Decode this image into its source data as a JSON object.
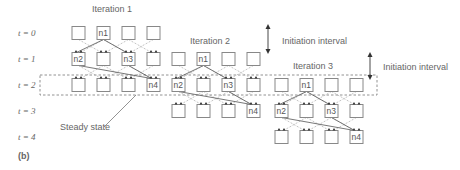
{
  "figure_label": "(b)",
  "time_rows": [
    {
      "label": "t = 0",
      "y": 33
    },
    {
      "label": "t = 1",
      "y": 59
    },
    {
      "label": "t = 2",
      "y": 85
    },
    {
      "label": "t = 3",
      "y": 111
    },
    {
      "label": "t = 4",
      "y": 137
    }
  ],
  "iterations": [
    {
      "title": "Iteration 1",
      "title_x": 92,
      "title_y": 12,
      "x0": 72,
      "row0": 0,
      "nodes": [
        {
          "label": "n1",
          "row": 0,
          "col": 1
        },
        {
          "label": "n2",
          "row": 1,
          "col": 0
        },
        {
          "label": "n3",
          "row": 1,
          "col": 2
        },
        {
          "label": "n4",
          "row": 2,
          "col": 3
        }
      ]
    },
    {
      "title": "Iteration 2",
      "title_x": 190,
      "title_y": 44,
      "x0": 172,
      "row0": 1,
      "nodes": [
        {
          "label": "n1",
          "row": 0,
          "col": 1
        },
        {
          "label": "n2",
          "row": 1,
          "col": 0
        },
        {
          "label": "n3",
          "row": 1,
          "col": 2
        },
        {
          "label": "n4",
          "row": 2,
          "col": 3
        }
      ]
    },
    {
      "title": "Iteration 3",
      "title_x": 293,
      "title_y": 69,
      "x0": 275,
      "row0": 2,
      "nodes": [
        {
          "label": "n1",
          "row": 0,
          "col": 1
        },
        {
          "label": "n2",
          "row": 1,
          "col": 0
        },
        {
          "label": "n3",
          "row": 1,
          "col": 2
        },
        {
          "label": "n4",
          "row": 2,
          "col": 3
        }
      ]
    }
  ],
  "annotations": {
    "initiation_interval_1": "Initiation interval",
    "initiation_interval_2": "Initiation interval",
    "steady_state": "Steady state"
  },
  "colors": {
    "box_stroke": "#888888",
    "line_solid": "#555555",
    "line_dashed": "#aaaaaa",
    "text": "#666666"
  }
}
